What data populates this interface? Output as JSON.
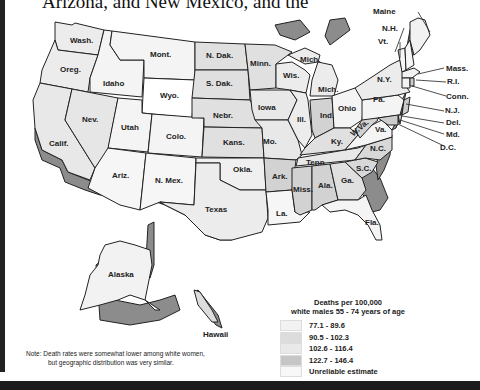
{
  "header": {
    "caption_fragment": "Arizona, and New Mexico, and the"
  },
  "map": {
    "type": "choropleth",
    "subject": "Deaths per 100,000 white males 55 - 74 years of age",
    "colors": {
      "class1": "#f2f2f2",
      "class2": "#dddddd",
      "class3": "#e8e8e8",
      "class4": "#c4c4c4",
      "unreliable": "#f8f8f8",
      "relief": "#8c8c8c",
      "border": "#222222"
    },
    "state_labels": {
      "wash": "Wash.",
      "oreg": "Oreg.",
      "calif": "Calif.",
      "idaho": "Idaho",
      "nev": "Nev.",
      "mont": "Mont.",
      "wyo": "Wyo.",
      "utah": "Utah",
      "colo": "Colo.",
      "ariz": "Ariz.",
      "nmex": "N. Mex.",
      "ndak": "N. Dak.",
      "sdak": "S. Dak.",
      "nebr": "Nebr.",
      "kans": "Kans.",
      "okla": "Okla.",
      "texas": "Texas",
      "minn": "Minn.",
      "iowa": "Iowa",
      "mo": "Mo.",
      "ark": "Ark.",
      "la": "La.",
      "wis": "Wis.",
      "mich_up": "Mich.",
      "mich": "Mich.",
      "ill": "Ill.",
      "ind": "Ind.",
      "ohio": "Ohio",
      "ky": "Ky.",
      "tenn": "Tenn.",
      "miss": "Miss.",
      "ala": "Ala.",
      "ga": "Ga.",
      "fla": "Fla.",
      "sc": "S.C.",
      "nc": "N.C.",
      "va": "Va.",
      "wva": "W.Va.",
      "pa": "Pa.",
      "ny": "N.Y.",
      "maine": "Maine",
      "nh": "N.H.",
      "vt": "Vt.",
      "mass": "Mass.",
      "ri": "R.I.",
      "conn": "Conn.",
      "nj": "N.J.",
      "del": "Del.",
      "md": "Md.",
      "dc": "D.C.",
      "alaska": "Alaska",
      "hawaii": "Hawaii"
    }
  },
  "legend": {
    "title_line1": "Deaths per 100,000",
    "title_line2": "white males 55 - 74 years of age",
    "items": [
      {
        "label": "77.1 - 89.6",
        "color": "#f2f2f2"
      },
      {
        "label": "90.5 - 102.3",
        "color": "#dcdcdc"
      },
      {
        "label": "102.6 - 116.4",
        "color": "#e9e9e9"
      },
      {
        "label": "122.7 - 146.4",
        "color": "#c6c6c6"
      },
      {
        "label": "Unreliable estimate",
        "color": "#f8f8f8"
      }
    ]
  },
  "note": {
    "line1": "Note:  Death rates were somewhat lower among white women,",
    "line2": "but geographic distribution was very similar."
  }
}
